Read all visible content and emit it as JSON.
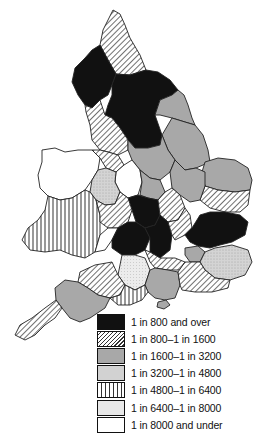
{
  "map": {
    "type": "choropleth",
    "region": "England and Wales by county",
    "fills": {
      "c1": {
        "style": "solid",
        "color": "#111111"
      },
      "c2": {
        "style": "diagonal-hatch",
        "color": "#444444"
      },
      "c3": {
        "style": "mid-grey",
        "color": "#a8a8a8"
      },
      "c4": {
        "style": "light-grey-stipple",
        "color": "#d2d2d2"
      },
      "c5": {
        "style": "vertical-lines",
        "color": "#333333"
      },
      "c6": {
        "style": "fine-stipple",
        "color": "#e6e6e6"
      },
      "c7": {
        "style": "white",
        "color": "#ffffff"
      }
    }
  },
  "legend": {
    "items": [
      {
        "key": "c1",
        "label": "1 in 800 and over"
      },
      {
        "key": "c2",
        "label": "1 in 800–1 in 1600"
      },
      {
        "key": "c3",
        "label": "1 in 1600–1 in 3200"
      },
      {
        "key": "c4",
        "label": "1 in 3200–1 in 4800"
      },
      {
        "key": "c5",
        "label": "1 in 4800–1 in 6400"
      },
      {
        "key": "c6",
        "label": "1 in 6400–1 in 8000"
      },
      {
        "key": "c7",
        "label": "1 in 8000 and under"
      }
    ]
  }
}
